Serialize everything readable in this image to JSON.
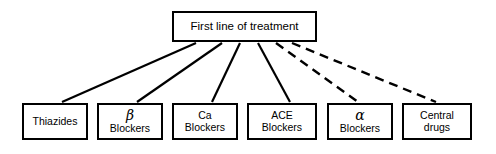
{
  "diagram": {
    "type": "hierarchy-tree",
    "orientation": "top-down",
    "background_color": "#ffffff",
    "line_color": "#000000",
    "root": {
      "id": "first-line-of-treatment",
      "label": "First line of treatment"
    },
    "leaves": [
      {
        "id": "thiazides",
        "line1": "Thiazides",
        "line2": "",
        "connector": "solid"
      },
      {
        "id": "beta-blockers",
        "line1": "β",
        "line2": "Blockers",
        "connector": "solid"
      },
      {
        "id": "ca-blockers",
        "line1": "Ca",
        "line2": "Blockers",
        "connector": "solid"
      },
      {
        "id": "ace-blockers",
        "line1": "ACE",
        "line2": "Blockers",
        "connector": "solid"
      },
      {
        "id": "alpha-blockers",
        "line1": "α",
        "line2": "Blockers",
        "connector": "dashed"
      },
      {
        "id": "central-drugs",
        "line1": "Central",
        "line2": "drugs",
        "connector": "dashed"
      }
    ]
  }
}
